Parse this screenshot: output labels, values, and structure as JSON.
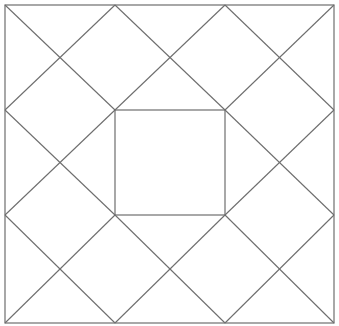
{
  "diagram": {
    "type": "quilt-block",
    "stroke_color": "#6e6e6e",
    "background": "#ffffff",
    "grid_x": [
      5,
      115,
      225,
      334
    ],
    "grid_y": [
      5,
      110,
      215,
      323
    ],
    "outer_square": {
      "x1": 5,
      "y1": 5,
      "x2": 334,
      "y2": 323
    },
    "center_square": {
      "x1": 115,
      "y1": 110,
      "x2": 225,
      "y2": 215
    },
    "crossed_cells": [
      [
        0,
        0
      ],
      [
        1,
        0
      ],
      [
        2,
        0
      ],
      [
        0,
        1
      ],
      [
        2,
        1
      ],
      [
        0,
        2
      ],
      [
        1,
        2
      ],
      [
        2,
        2
      ]
    ]
  }
}
